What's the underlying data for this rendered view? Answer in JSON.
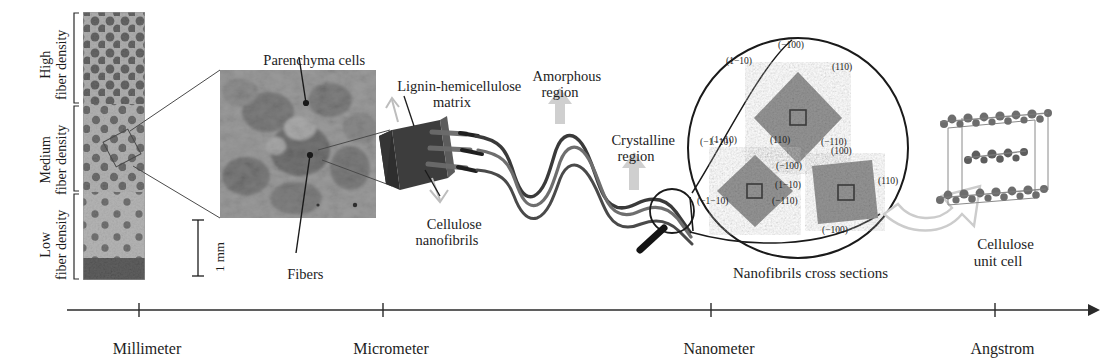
{
  "density_brackets": [
    {
      "id": "high",
      "label": "High\nfiber density"
    },
    {
      "id": "medium",
      "label": "Medium\nfiber density"
    },
    {
      "id": "low",
      "label": "Low\nfiber density"
    }
  ],
  "scalebar": {
    "label": "1 mm"
  },
  "callouts": {
    "parenchyma": "Parenchyma cells",
    "fibers": "Fibers",
    "lignin_matrix": "Lignin-hemicellulose\nmatrix",
    "cellulose_nanofibrils": "Cellulose\nnanofibrils",
    "amorphous": "Amorphous\nregion",
    "crystalline": "Crystalline\nregion",
    "cross_sections": "Nanofibrils cross sections",
    "unit_cell": "Cellulose\nunit cell"
  },
  "cross_sections": [
    {
      "id": "diamond-top",
      "shape": "diamond",
      "planes": {
        "top": "(−100)",
        "upper_left": "(1−10)",
        "upper_right": "(110)",
        "lower_left": "(−1−10)",
        "lower_right": "(−110)",
        "bottom": "(−100)"
      }
    },
    {
      "id": "diamond-left",
      "shape": "diamond",
      "planes": {
        "upper_left": "(1−10)",
        "upper_right": "(110)",
        "lower_left": "(−1−10)",
        "lower_right": "(−110)"
      }
    },
    {
      "id": "square-right",
      "shape": "square",
      "planes": {
        "top": "(100)",
        "right": "(110)",
        "left": "(1−10)",
        "bottom": "(−100)"
      }
    }
  ],
  "scale_axis": {
    "ticks": [
      {
        "label": "Millimeter",
        "x": 139
      },
      {
        "label": "Micrometer",
        "x": 383
      },
      {
        "label": "Nanometer",
        "x": 711
      },
      {
        "label": "Angstrom",
        "x": 995
      }
    ]
  },
  "colors": {
    "ink": "#1d1d1d",
    "micrograph_mid": "#8d8d8d",
    "micrograph_dark": "#555555",
    "block_dark": "#3b3b3b",
    "crosssection_fill": "#9a9a9a",
    "arrow_gray": "#c9c9c9",
    "axis": "#2a2a2a"
  }
}
